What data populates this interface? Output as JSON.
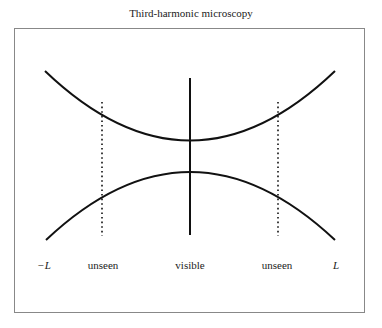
{
  "title": "Third-harmonic microscopy",
  "labels": {
    "left_bound": "−L",
    "left_region": "unseen",
    "center_region": "visible",
    "right_region": "unseen",
    "right_bound": "L"
  },
  "geometry": {
    "frame": {
      "x": 14,
      "y": 28,
      "width": 351,
      "height": 285
    },
    "upper_curve": {
      "start": [
        45,
        71
      ],
      "vertex": [
        190,
        140
      ],
      "end": [
        335,
        71
      ]
    },
    "lower_curve": {
      "start": [
        46,
        240
      ],
      "vertex": [
        190,
        172
      ],
      "end": [
        335,
        240
      ]
    },
    "center_line": {
      "x": 190,
      "y1": 78,
      "y2": 235,
      "style": "solid"
    },
    "left_dotted_line": {
      "x": 102,
      "y1": 102,
      "y2": 236,
      "style": "dotted"
    },
    "right_dotted_line": {
      "x": 278,
      "y1": 102,
      "y2": 236,
      "style": "dotted"
    }
  },
  "colors": {
    "stroke": "#111111",
    "frame": "#888888",
    "text": "#222222"
  }
}
